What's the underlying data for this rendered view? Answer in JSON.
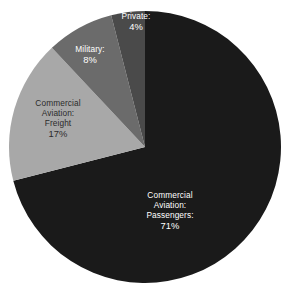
{
  "chart_data": {
    "type": "pie",
    "title": "",
    "subtitle": "",
    "xlabel": "",
    "ylabel": "",
    "legend": "none",
    "grid": false,
    "units": "percent",
    "start_angle_deg": 0,
    "direction": "clockwise",
    "categories": [
      "Commercial Aviation: Passengers",
      "Commercial Aviation: Freight",
      "Military",
      "Private"
    ],
    "values": [
      71,
      17,
      8,
      4
    ],
    "slices": [
      {
        "key": "passengers",
        "name": "Commercial Aviation: Passengers",
        "line1": "Commercial",
        "line2": "Aviation:",
        "line3": "Passengers:",
        "value": 71,
        "percent_label": "71%",
        "color": "#1a1a1a",
        "label_color": "#ffffff"
      },
      {
        "key": "freight",
        "name": "Commercial Aviation: Freight",
        "line1": "Commercial",
        "line2": "Aviation:",
        "line3": "Freight",
        "value": 17,
        "percent_label": "17%",
        "color": "#a8a8a8",
        "label_color": "#2b2b2b"
      },
      {
        "key": "military",
        "name": "Military",
        "line1": "Military:",
        "line2": "",
        "line3": "",
        "value": 8,
        "percent_label": "8%",
        "color": "#6b6b6b",
        "label_color": "#ffffff"
      },
      {
        "key": "private",
        "name": "Private",
        "line1": "Private:",
        "line2": "",
        "line3": "",
        "value": 4,
        "percent_label": "4%",
        "color": "#4a4a4a",
        "label_color": "#ffffff"
      }
    ],
    "background_color": "#ffffff"
  },
  "geometry": {
    "center_x": 145,
    "center_y": 147,
    "radius": 136
  }
}
